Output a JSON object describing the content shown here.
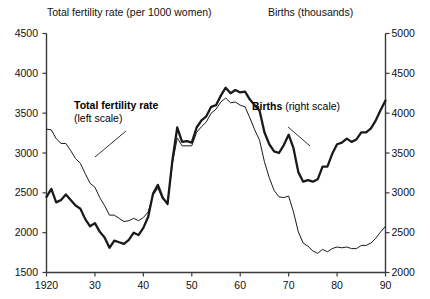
{
  "header": {
    "left_title": "Total fertility rate (per 1000 women)",
    "right_title": "Births (thousands)"
  },
  "annotations": {
    "fertility_bold": "Total fertility rate",
    "fertility_sub": "(left scale)",
    "births_bold": "Births",
    "births_sub": "(right scale)"
  },
  "axes": {
    "left_ticks": [
      "4500",
      "4000",
      "3500",
      "3000",
      "2500",
      "2000",
      "1500"
    ],
    "right_ticks": [
      "5000",
      "4500",
      "4000",
      "3500",
      "3000",
      "2500",
      "2000"
    ],
    "x_ticks": [
      "1920",
      "30",
      "40",
      "50",
      "60",
      "70",
      "80",
      "90"
    ]
  },
  "colors": {
    "line": "#1a1a1a",
    "axis": "#3a3a3a",
    "background": "#ffffff"
  },
  "chart_data": {
    "type": "line",
    "title": "",
    "xlabel": "",
    "ylabel": "Total fertility rate (per 1000 women)",
    "y2label": "Births (thousands)",
    "grid": false,
    "legend": "inline-annotation",
    "xlim": [
      1920,
      1990
    ],
    "ylim": [
      1500,
      4500
    ],
    "y2lim": [
      2000,
      5000
    ],
    "x": [
      1920,
      1921,
      1922,
      1923,
      1924,
      1925,
      1926,
      1927,
      1928,
      1929,
      1930,
      1931,
      1932,
      1933,
      1934,
      1935,
      1936,
      1937,
      1938,
      1939,
      1940,
      1941,
      1942,
      1943,
      1944,
      1945,
      1946,
      1947,
      1948,
      1949,
      1950,
      1951,
      1952,
      1953,
      1954,
      1955,
      1956,
      1957,
      1958,
      1959,
      1960,
      1961,
      1962,
      1963,
      1964,
      1965,
      1966,
      1967,
      1968,
      1969,
      1970,
      1971,
      1972,
      1973,
      1974,
      1975,
      1976,
      1977,
      1978,
      1979,
      1980,
      1981,
      1982,
      1983,
      1984,
      1985,
      1986,
      1987,
      1988,
      1989,
      1990
    ],
    "series": [
      {
        "name": "Total fertility rate",
        "axis": "left",
        "units": "per 1000 women",
        "style": "thin",
        "values": [
          3300,
          3290,
          3180,
          3120,
          3120,
          3030,
          2930,
          2870,
          2740,
          2620,
          2570,
          2440,
          2340,
          2220,
          2220,
          2180,
          2140,
          2150,
          2180,
          2150,
          2190,
          2260,
          2470,
          2560,
          2420,
          2380,
          2870,
          3190,
          3090,
          3090,
          3090,
          3260,
          3330,
          3390,
          3500,
          3550,
          3640,
          3690,
          3630,
          3640,
          3600,
          3580,
          3440,
          3290,
          3160,
          2890,
          2690,
          2530,
          2450,
          2440,
          2460,
          2260,
          2010,
          1870,
          1830,
          1770,
          1740,
          1790,
          1760,
          1800,
          1820,
          1810,
          1820,
          1800,
          1800,
          1840,
          1840,
          1870,
          1930,
          2010,
          2080
        ]
      },
      {
        "name": "Births",
        "axis": "right",
        "units": "thousands",
        "style": "thick",
        "values": [
          2950,
          3050,
          2880,
          2910,
          2980,
          2910,
          2840,
          2800,
          2670,
          2580,
          2620,
          2510,
          2440,
          2310,
          2400,
          2380,
          2360,
          2410,
          2500,
          2470,
          2560,
          2700,
          2990,
          3100,
          2940,
          2860,
          3410,
          3820,
          3640,
          3650,
          3630,
          3820,
          3910,
          3960,
          4080,
          4100,
          4220,
          4320,
          4250,
          4290,
          4260,
          4270,
          4170,
          4100,
          4030,
          3760,
          3610,
          3520,
          3500,
          3600,
          3730,
          3560,
          3260,
          3140,
          3160,
          3140,
          3170,
          3330,
          3330,
          3490,
          3610,
          3630,
          3680,
          3640,
          3670,
          3760,
          3760,
          3810,
          3910,
          4040,
          4160
        ]
      }
    ]
  }
}
